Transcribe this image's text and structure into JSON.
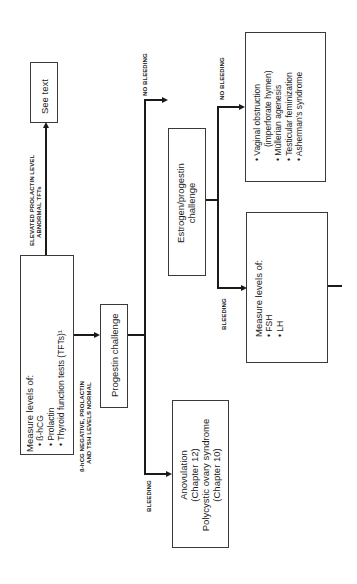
{
  "diagram": {
    "orientation": "rotated-90-ccw",
    "nodes": {
      "measure_initial": {
        "title": "Measure levels of:",
        "items": [
          "• ß-hCG",
          "• Prolactin",
          "• Thyroid function tests (TFTs)¹"
        ]
      },
      "see_text": {
        "label": "See text"
      },
      "progestin": {
        "label": "Progestin challenge"
      },
      "anovulation": {
        "lines": [
          "Anovulation",
          "(Chapter 12)",
          "Polycystic ovary syndrome",
          "(Chapter 10)"
        ]
      },
      "estrogen_progestin": {
        "lines": [
          "Estrogen/progestin",
          "challenge"
        ]
      },
      "outflow_causes": {
        "items": [
          "• Vaginal obstruction",
          "(imperforate hymen)",
          "• Müllerian agenesis",
          "• Testicular feminization",
          "• Asherman's syndrome"
        ]
      },
      "measure_fsh_lh": {
        "title": "Measure levels of:",
        "items": [
          "• FSH",
          "• LH"
        ]
      }
    },
    "edges": {
      "elevated": {
        "lines": [
          "ELEVATED PROLACTIN LEVEL",
          "ABNORMAL TFTs"
        ]
      },
      "normal": {
        "lines": [
          "ß-hCG NEGATIVE, PROLACTIN",
          "AND TSH LEVELS NORMAL"
        ]
      },
      "bleeding_1": {
        "label": "BLEEDING"
      },
      "no_bleeding_1": {
        "label": "NO BLEEDING"
      },
      "bleeding_2": {
        "label": "BLEEDING"
      },
      "no_bleeding_2": {
        "label": "NO BLEEDING"
      }
    }
  }
}
